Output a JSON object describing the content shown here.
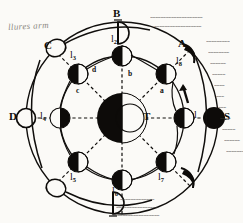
{
  "figure": {
    "type": "lunar-phase-diagram",
    "center_body": {
      "label": "T",
      "name": "earth",
      "meaning": "Terra"
    },
    "sun_direction": {
      "label": "S",
      "name": "sun-direction",
      "side": "right"
    },
    "margin_note": "llures arm",
    "ink_color": "#100e0c",
    "paper_color": "#fbfaf7"
  },
  "inner_moons": [
    {
      "id": "m1",
      "label": "l",
      "sub": "1",
      "phase": "last-quarter",
      "lit": "right",
      "angle": 0,
      "side_letter": "a"
    },
    {
      "id": "m2",
      "label": "l",
      "sub": "2",
      "phase": "waning-gibbous",
      "lit": "right",
      "angle": 45,
      "side_letter": "b"
    },
    {
      "id": "m3",
      "label": "l",
      "sub": "3",
      "phase": "new-moon",
      "lit": "none",
      "angle": 90,
      "side_letter": ""
    },
    {
      "id": "m4",
      "label": "l",
      "sub": "4",
      "phase": "waxing-gibbous",
      "lit": "left",
      "angle": 135,
      "side_letter": "d"
    },
    {
      "id": "m5",
      "label": "l",
      "sub": "5",
      "phase": "first-quarter",
      "lit": "left",
      "angle": 180,
      "side_letter": ""
    },
    {
      "id": "m6",
      "label": "l",
      "sub": "6",
      "phase": "waxing-crescent",
      "lit": "left",
      "angle": 225,
      "side_letter": ""
    },
    {
      "id": "m7",
      "label": "l",
      "sub": "7",
      "phase": "full-moon",
      "lit": "none",
      "angle": 270,
      "side_letter": ""
    },
    {
      "id": "m8",
      "label": "l",
      "sub": "8",
      "phase": "waning-crescent",
      "lit": "right",
      "angle": 315,
      "side_letter": ""
    }
  ],
  "center_letters": [
    {
      "id": "a",
      "text": "a"
    },
    {
      "id": "b",
      "text": "b"
    },
    {
      "id": "c",
      "text": "c"
    },
    {
      "id": "d",
      "text": "d"
    }
  ],
  "outer_marks": [
    {
      "id": "A",
      "text": "A",
      "shape": "crescent-left",
      "position": "upper-right"
    },
    {
      "id": "B",
      "text": "B",
      "shape": "half-disc-right",
      "position": "top"
    },
    {
      "id": "C",
      "text": "C",
      "shape": "open-circle",
      "position": "upper-left"
    },
    {
      "id": "D",
      "text": "D",
      "shape": "open-circle",
      "position": "left"
    }
  ],
  "unlabeled_outer": [
    {
      "id": "ol-bottom-left",
      "shape": "open-circle",
      "position": "lower-left"
    },
    {
      "id": "ol-bottom",
      "shape": "half-disc-right",
      "position": "bottom"
    },
    {
      "id": "ol-bottom-right",
      "shape": "crescent-left",
      "position": "lower-right"
    },
    {
      "id": "ol-right",
      "shape": "dark-disc",
      "position": "right"
    }
  ],
  "hatching": {
    "name": "sun-ray-hatching",
    "rows_right": [
      "~~~~~~~~~",
      "~~~~~~~~",
      "~~~~~~",
      "~~~~~",
      "~~~~",
      "~~~",
      "~~~",
      "~~~~",
      "~~~~~",
      "~~~~~~",
      "~~~~~~~"
    ],
    "rows_bottom": [
      "~~~~~~~~~~~~~",
      "~~~~~~~~~~~~~~~~",
      "~~~~~~~~~~~~~~~~~~"
    ],
    "rows_top": [
      "~~~~~~~~~~~~~~~~~~~~",
      "~~~~~~~~~~~~~~~~~~"
    ]
  }
}
